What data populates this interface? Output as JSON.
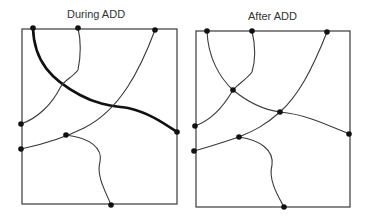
{
  "panels": [
    {
      "title": "During ADD",
      "box": {
        "x": 22,
        "y": 29,
        "w": 155,
        "h": 175
      },
      "nodes": [
        [
          33,
          28
        ],
        [
          78,
          28
        ],
        [
          155,
          30
        ],
        [
          21,
          124
        ],
        [
          21,
          149
        ],
        [
          66,
          135
        ],
        [
          177,
          132
        ],
        [
          111,
          205
        ]
      ],
      "curves": [
        {
          "d": "M33,28 C34,62 52,80 80,95 C100,106 116,106 128,108 C150,113 165,124 177,132",
          "thick": true
        },
        {
          "d": "M78,28 C82,45 80,60 78,70 C72,78 64,80 60,88 C52,104 38,118 21,124",
          "thick": false
        },
        {
          "d": "M155,30 C140,70 120,110 84,128 C60,140 40,145 21,149",
          "thick": false
        },
        {
          "d": "M66,135 C90,138 103,148 100,162 C96,176 106,192 111,205",
          "thick": false
        }
      ]
    },
    {
      "title": "After ADD",
      "box": {
        "x": 196,
        "y": 31,
        "w": 154,
        "h": 176
      },
      "nodes": [
        [
          207,
          31
        ],
        [
          252,
          31
        ],
        [
          327,
          32
        ],
        [
          195,
          126
        ],
        [
          194,
          151
        ],
        [
          239,
          137
        ],
        [
          349,
          134
        ],
        [
          284,
          207
        ],
        [
          233,
          90
        ],
        [
          280,
          112
        ]
      ],
      "curves": [
        {
          "d": "M207,31 C208,58 220,78 233,90 C250,104 265,110 280,112 C305,114 330,126 349,134",
          "thick": false
        },
        {
          "d": "M252,31 C256,48 255,62 252,72 C246,80 238,84 233,90 C225,104 212,120 195,126",
          "thick": false
        },
        {
          "d": "M327,32 C312,70 298,96 280,112 C262,128 250,132 239,137 C218,144 205,148 194,151",
          "thick": false
        },
        {
          "d": "M239,137 C260,140 274,150 272,165 C268,180 278,196 284,207",
          "thick": false
        }
      ]
    }
  ],
  "colors": {
    "line": "#3a3a3a",
    "node": "#111111"
  }
}
